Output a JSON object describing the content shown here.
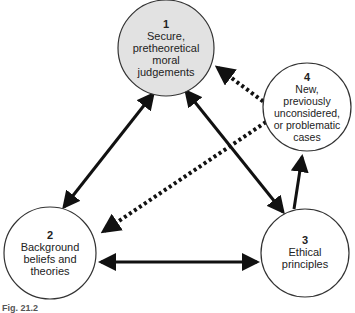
{
  "nodes": [
    {
      "id": 1,
      "number": "1",
      "lines": [
        "Secure,",
        "pretheoretical",
        "moral",
        "judgements"
      ],
      "cx": 166,
      "cy": 48,
      "r": 48,
      "fill": "#e2e2e2"
    },
    {
      "id": 2,
      "number": "2",
      "lines": [
        "Background",
        "beliefs and",
        "theories"
      ],
      "cx": 50,
      "cy": 253,
      "r": 46,
      "fill": "#ffffff"
    },
    {
      "id": 3,
      "number": "3",
      "lines": [
        "Ethical",
        "principles"
      ],
      "cx": 305,
      "cy": 253,
      "r": 44,
      "fill": "#ffffff"
    },
    {
      "id": 4,
      "number": "4",
      "lines": [
        "New,",
        "previously",
        "unconsidered,",
        "or problematic",
        "cases"
      ],
      "cx": 307,
      "cy": 107,
      "r": 44,
      "fill": "#ffffff"
    }
  ],
  "edges": [
    {
      "from": 1,
      "to": 2,
      "style": "solid",
      "direction": "both"
    },
    {
      "from": 1,
      "to": 3,
      "style": "solid",
      "direction": "both"
    },
    {
      "from": 2,
      "to": 3,
      "style": "solid",
      "direction": "both"
    },
    {
      "from": 3,
      "to": 4,
      "style": "solid",
      "direction": "forward"
    },
    {
      "from": 4,
      "to": 1,
      "style": "dotted",
      "direction": "forward"
    },
    {
      "from": 4,
      "to": 2,
      "style": "dotted",
      "direction": "forward"
    }
  ],
  "caption": "Fig. 21.2",
  "colors": {
    "stroke": "#111111",
    "circle_stroke": "#333333",
    "node1_fill": "#e2e2e2"
  }
}
